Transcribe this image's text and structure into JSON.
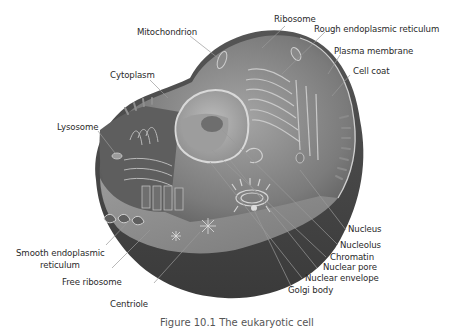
{
  "figure": {
    "type": "labeled-illustration",
    "caption_partial": "Figure 10.1 The eukaryotic cell",
    "colors": {
      "background": "#ffffff",
      "cytoplasm_dark": "#6b6b6b",
      "cytoplasm_mid": "#8c8c8c",
      "cytoplasm_light": "#a9a9a9",
      "nucleus_dark": "#4a4a4a",
      "leader_line": "#9a9a9a",
      "label_text": "#2a2a2a"
    }
  },
  "labels": {
    "mitochondrion": "Mitochondrion",
    "ribosome": "Ribosome",
    "rough_er": "Rough endoplasmic reticulum",
    "plasma_membrane": "Plasma membrane",
    "cell_coat": "Cell coat",
    "cytoplasm": "Cytoplasm",
    "lysosome": "Lysosome",
    "smooth_er_line1": "Smooth endoplasmic",
    "smooth_er_line2": "reticulum",
    "free_ribosome": "Free ribosome",
    "centriole": "Centriole",
    "nucleus": "Nucleus",
    "nucleolus": "Nucleolus",
    "chromatin": "Chromatin",
    "nuclear_pore": "Nuclear pore",
    "nuclear_envelope": "Nuclear envelope",
    "golgi_body": "Golgi body"
  }
}
